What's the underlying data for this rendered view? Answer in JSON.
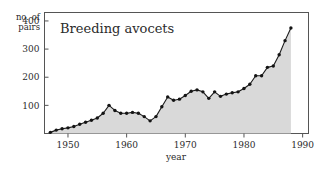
{
  "chart_data": {
    "type": "area",
    "title": "Breeding avocets",
    "xlabel": "year",
    "ylabel_lines": [
      "no. of",
      "pairs"
    ],
    "ylabel": "no. of pairs",
    "xlim": [
      1946,
      1991
    ],
    "ylim": [
      0,
      430
    ],
    "xticks": [
      1950,
      1960,
      1970,
      1980,
      1990
    ],
    "yticks": [
      100,
      200,
      300,
      400
    ],
    "grid": false,
    "legend": null,
    "fill_color": "#d9d9d9",
    "line_color": "#1c1c1c",
    "marker_color": "#141414",
    "x": [
      1947,
      1948,
      1949,
      1950,
      1951,
      1952,
      1953,
      1954,
      1955,
      1956,
      1957,
      1958,
      1959,
      1960,
      1961,
      1962,
      1963,
      1964,
      1965,
      1966,
      1967,
      1968,
      1969,
      1970,
      1971,
      1972,
      1973,
      1974,
      1975,
      1976,
      1977,
      1978,
      1979,
      1980,
      1981,
      1982,
      1983,
      1984,
      1985,
      1986,
      1987,
      1988
    ],
    "values": [
      4,
      12,
      17,
      20,
      25,
      33,
      40,
      47,
      55,
      72,
      100,
      82,
      72,
      72,
      75,
      72,
      60,
      45,
      60,
      95,
      130,
      118,
      122,
      135,
      150,
      155,
      148,
      125,
      148,
      132,
      140,
      145,
      148,
      160,
      175,
      205,
      205,
      235,
      240,
      280,
      330,
      375
    ]
  },
  "chart_meta": {
    "title_label": "Breeding avocets",
    "y_axis_label_top": "no. of",
    "y_axis_label_bottom": "pairs",
    "x_axis_label": "year"
  }
}
